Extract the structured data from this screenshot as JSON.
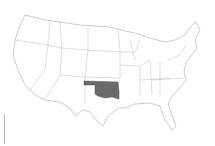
{
  "map": {
    "title": "United States",
    "highlighted_state": "Oklahoma",
    "highlight_color": "#6a6a6a",
    "border_color": "#9a9a9a",
    "background": "#ffffff"
  }
}
